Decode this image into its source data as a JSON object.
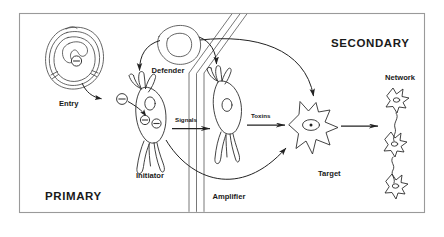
{
  "figure": {
    "type": "schematic-diagram",
    "title": "",
    "background_color": "#ffffff",
    "frame_color": "#9a9a9a",
    "ink_color": "#2e2e2e"
  },
  "sections": {
    "primary": {
      "label": "PRIMARY",
      "position": "bottom-left"
    },
    "secondary": {
      "label": "SECONDARY",
      "position": "top-right"
    }
  },
  "nodes": {
    "entry_cell": {
      "label": "Entry",
      "shape": "round-engulfing-cell",
      "marker": "circled-minus",
      "marker_count": 1
    },
    "defender_cell": {
      "label": "Defender",
      "shape": "round-cell-with-nucleus"
    },
    "initiator_cell": {
      "label": "Initiator",
      "shape": "neuron",
      "marker": "circled-minus",
      "marker_count": 2
    },
    "amplifier_cell": {
      "label": "Amplifier",
      "shape": "neuron"
    },
    "target_cell": {
      "label": "Target",
      "shape": "star-astrocyte",
      "marker": "nucleus-dot"
    },
    "network": {
      "label": "Network",
      "shape": "chain-of-star-cells",
      "cell_count": 3
    }
  },
  "flows": {
    "signals": {
      "label": "Signals",
      "from": "initiator_cell",
      "to": "amplifier_cell",
      "style": "straight-arrow"
    },
    "toxins": {
      "label": "Toxins",
      "from": "amplifier_cell",
      "to": "target_cell",
      "style": "straight-arrow"
    },
    "target_to_network": {
      "label": "",
      "from": "target_cell",
      "to": "network",
      "style": "straight-arrow"
    },
    "entry_to_initiator": {
      "label": "",
      "from": "entry_cell",
      "to": "initiator_cell",
      "style": "curved-arrow"
    },
    "defender_to_initiator": {
      "label": "",
      "from": "defender_cell",
      "to": "initiator_cell",
      "style": "curved-arrow"
    },
    "defender_to_target": {
      "label": "",
      "from": "defender_cell",
      "to": "target_cell",
      "style": "long-curved-arrow"
    },
    "initiator_to_target": {
      "label": "",
      "from": "initiator_cell",
      "to": "target_cell",
      "style": "long-curved-arrow-lower"
    }
  },
  "barrier": {
    "name": "barrier",
    "description": "double-line vertical barrier separating primary and secondary compartments"
  },
  "symbols": {
    "circled_minus": "⊖"
  }
}
